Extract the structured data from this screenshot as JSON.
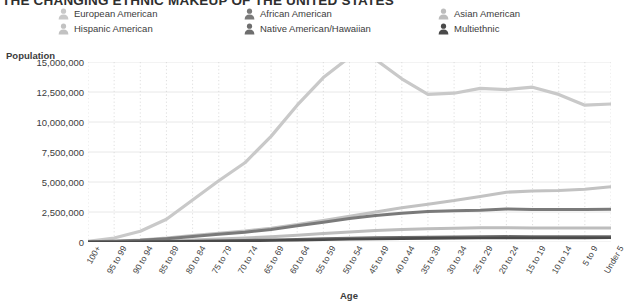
{
  "header": {
    "title": "THE CHANGING ETHNIC MAKEUP OF THE UNITED STATES"
  },
  "legend": {
    "position": "top",
    "icon": "person-icon",
    "entries": [
      {
        "label": "European American",
        "color": "#c9c9c9",
        "col": 1,
        "row": 1
      },
      {
        "label": "Hispanic American",
        "color": "#c2c2c2",
        "col": 1,
        "row": 2
      },
      {
        "label": "African American",
        "color": "#7a7a7a",
        "col": 2,
        "row": 1
      },
      {
        "label": "Native American/Hawaiian",
        "color": "#6e6e6e",
        "col": 2,
        "row": 2
      },
      {
        "label": "Asian American",
        "color": "#bdbdbd",
        "col": 3,
        "row": 1
      },
      {
        "label": "Multiethnic",
        "color": "#4a4a4a",
        "col": 3,
        "row": 2
      }
    ]
  },
  "chart_data": {
    "type": "line",
    "title": "THE CHANGING ETHNIC MAKEUP OF THE UNITED STATES",
    "xlabel": "Age",
    "ylabel": "Population",
    "ylim": [
      0,
      15000000
    ],
    "ytick_step": 2500000,
    "yticks": [
      0,
      2500000,
      5000000,
      7500000,
      10000000,
      12500000,
      15000000
    ],
    "ytick_labels": [
      "0",
      "2,500,000",
      "5,000,000",
      "7,500,000",
      "10,000,000",
      "12,500,000",
      "15,000,000"
    ],
    "grid": true,
    "grid_color": "#e8e8e8",
    "categories": [
      "100+",
      "95 to 99",
      "90 to 94",
      "85 to 89",
      "80 to 84",
      "75 to 79",
      "70 to 74",
      "65 to 69",
      "60 to 64",
      "55 to 59",
      "50 to 54",
      "45 to 49",
      "40 to 44",
      "35 to 39",
      "30 to 34",
      "25 to 29",
      "20 to 24",
      "15 to 19",
      "10 to 14",
      "5 to 9",
      "Under 5"
    ],
    "series": [
      {
        "name": "European American",
        "color": "#c9c9c9",
        "width": 3.2,
        "values": [
          60000,
          330000,
          900000,
          1900000,
          3500000,
          5100000,
          6600000,
          8800000,
          11400000,
          13700000,
          15400000,
          15200000,
          13600000,
          12300000,
          12400000,
          12800000,
          12700000,
          12900000,
          12300000,
          11400000,
          11500000
        ]
      },
      {
        "name": "Hispanic American",
        "color": "#c2c2c2",
        "width": 3.0,
        "values": [
          15000,
          70000,
          170000,
          330000,
          540000,
          740000,
          920000,
          1150000,
          1450000,
          1800000,
          2150000,
          2500000,
          2850000,
          3150000,
          3450000,
          3800000,
          4150000,
          4250000,
          4300000,
          4400000,
          4600000
        ]
      },
      {
        "name": "African American",
        "color": "#7a7a7a",
        "width": 3.0,
        "values": [
          12000,
          55000,
          140000,
          280000,
          460000,
          640000,
          820000,
          1050000,
          1350000,
          1650000,
          1950000,
          2200000,
          2400000,
          2550000,
          2600000,
          2650000,
          2750000,
          2700000,
          2700000,
          2700000,
          2720000
        ]
      },
      {
        "name": "Asian American",
        "color": "#bdbdbd",
        "width": 3.0,
        "values": [
          4000,
          18000,
          48000,
          100000,
          175000,
          250000,
          330000,
          430000,
          560000,
          700000,
          840000,
          950000,
          1040000,
          1100000,
          1150000,
          1180000,
          1190000,
          1170000,
          1160000,
          1160000,
          1170000
        ]
      },
      {
        "name": "Native American/Hawaiian",
        "color": "#6e6e6e",
        "width": 2.6,
        "values": [
          2000,
          8000,
          20000,
          42000,
          72000,
          105000,
          140000,
          180000,
          230000,
          280000,
          330000,
          370000,
          400000,
          420000,
          440000,
          455000,
          465000,
          460000,
          460000,
          455000,
          460000
        ]
      },
      {
        "name": "Multiethnic",
        "color": "#4a4a4a",
        "width": 2.6,
        "values": [
          1500,
          6000,
          15000,
          30000,
          50000,
          72000,
          95000,
          120000,
          155000,
          190000,
          225000,
          255000,
          280000,
          300000,
          320000,
          335000,
          345000,
          345000,
          345000,
          345000,
          350000
        ]
      }
    ]
  },
  "axes": {
    "y_title": "Population",
    "x_title": "Age"
  }
}
